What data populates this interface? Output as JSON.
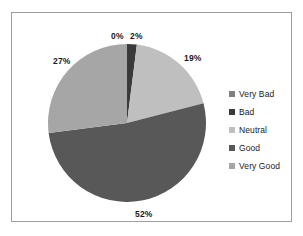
{
  "chart_data": {
    "type": "pie",
    "title": "",
    "subtitle": "",
    "xlabel": "",
    "ylabel": "",
    "grid": false,
    "legend_position": "right",
    "categories": [
      "Very Bad",
      "Bad",
      "Neutral",
      "Good",
      "Very Good"
    ],
    "values": [
      0,
      2,
      19,
      52,
      27
    ],
    "value_labels": [
      "0%",
      "2%",
      "19%",
      "52%",
      "27%"
    ],
    "colors": [
      "#808080",
      "#3a3a3a",
      "#bfbfbf",
      "#585858",
      "#a6a6a6"
    ],
    "slices": [
      {
        "label": "Very Bad",
        "value": 0,
        "display": "0%",
        "color": "#808080"
      },
      {
        "label": "Bad",
        "value": 2,
        "display": "2%",
        "color": "#3a3a3a"
      },
      {
        "label": "Neutral",
        "value": 19,
        "display": "19%",
        "color": "#bfbfbf"
      },
      {
        "label": "Good",
        "value": 52,
        "display": "52%",
        "color": "#585858"
      },
      {
        "label": "Very Good",
        "value": 27,
        "display": "27%",
        "color": "#a6a6a6"
      }
    ],
    "units": "percent",
    "total": 100
  },
  "frame": {
    "border_color": "#9e9e9e",
    "background": "#ffffff"
  },
  "legend": {
    "items": [
      {
        "label": "Very Bad",
        "color": "#808080"
      },
      {
        "label": "Bad",
        "color": "#3a3a3a"
      },
      {
        "label": "Neutral",
        "color": "#bfbfbf"
      },
      {
        "label": "Good",
        "color": "#585858"
      },
      {
        "label": "Very Good",
        "color": "#a6a6a6"
      }
    ]
  }
}
